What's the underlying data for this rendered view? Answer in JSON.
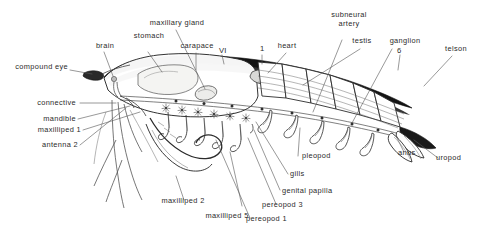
{
  "figure": {
    "background_color": "#ffffff",
    "ink_color": "#1c1c1c",
    "label_color": "#2a2a2a"
  },
  "labels": {
    "compound_eye": "compound eye",
    "brain": "brain",
    "stomach": "stomach",
    "maxillary_gland": "maxillary gland",
    "carapace": "carapace",
    "segment_six_roman": "VI",
    "segment_one": "1",
    "heart": "heart",
    "subneural_artery_line1": "subneural",
    "subneural_artery_line2": "artery",
    "testis": "testis",
    "ganglion": "ganglion",
    "segment_six": "6",
    "telson": "telson",
    "connective": "connective",
    "mandible": "mandible",
    "maxilliped_1": "maxilliped 1",
    "antenna_2": "antenna 2",
    "maxilliped_2": "maxilliped 2",
    "maxilliped_5": "maxilliped 5",
    "pereopod_1": "pereopod 1",
    "pereopod_3": "pereopod 3",
    "genital_papilla": "genital papilla",
    "gills": "gills",
    "pleopod": "pleopod",
    "anus": "anus",
    "uropod": "uropod"
  }
}
